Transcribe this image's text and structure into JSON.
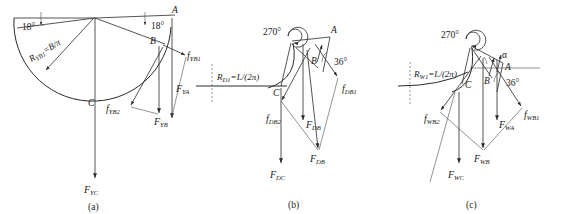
{
  "figure": {
    "panels": [
      {
        "id": "a",
        "caption": "(a)",
        "angles": [
          {
            "name": "left-18",
            "value": "18°"
          },
          {
            "name": "right-18",
            "value": "18°"
          }
        ],
        "points": [
          {
            "name": "A",
            "label": "A"
          },
          {
            "name": "B",
            "label": "B"
          },
          {
            "name": "C",
            "label": "C"
          }
        ],
        "radius_label": {
          "base": "R",
          "sub": "YB1",
          "rest": "=B/π"
        },
        "forces": [
          {
            "name": "f-YB1",
            "base": "f",
            "sub": "YB1"
          },
          {
            "name": "F-YA",
            "base": "F",
            "sub": "YA"
          },
          {
            "name": "F-YB",
            "base": "F",
            "sub": "YB"
          },
          {
            "name": "f-YB2",
            "base": "f",
            "sub": "YB2"
          },
          {
            "name": "F-YC",
            "base": "F",
            "sub": "YC"
          }
        ]
      },
      {
        "id": "b",
        "caption": "(b)",
        "angles": [
          {
            "name": "spiral-270",
            "value": "270°"
          },
          {
            "name": "angle-36",
            "value": "36°"
          }
        ],
        "points": [
          {
            "name": "A",
            "label": "A"
          },
          {
            "name": "B",
            "label": "B"
          },
          {
            "name": "C",
            "label": "C"
          }
        ],
        "radius_label": {
          "base": "R",
          "sub": "D1",
          "rest": "=L/(2π)"
        },
        "forces": [
          {
            "name": "f-DB1",
            "base": "f",
            "sub": "DB1"
          },
          {
            "name": "F-DB-upper",
            "base": "F",
            "sub": "DB"
          },
          {
            "name": "f-DB2",
            "base": "f",
            "sub": "DB2"
          },
          {
            "name": "F-DB-lower",
            "base": "F",
            "sub": "DB"
          },
          {
            "name": "F-DC",
            "base": "F",
            "sub": "DC"
          }
        ]
      },
      {
        "id": "c",
        "caption": "(c)",
        "angles": [
          {
            "name": "spiral-270",
            "value": "270°"
          },
          {
            "name": "angle-36",
            "value": "36°"
          },
          {
            "name": "alpha",
            "value": "α"
          }
        ],
        "points": [
          {
            "name": "A",
            "label": "A"
          },
          {
            "name": "B",
            "label": "B"
          },
          {
            "name": "C",
            "label": "C"
          }
        ],
        "radius_label": {
          "base": "R",
          "sub": "W1",
          "rest": "=L/(2π)"
        },
        "forces": [
          {
            "name": "f-WB1",
            "base": "f",
            "sub": "WB1"
          },
          {
            "name": "F-WA",
            "base": "F",
            "sub": "WA"
          },
          {
            "name": "f-WB2",
            "base": "f",
            "sub": "WB2"
          },
          {
            "name": "F-WB",
            "base": "F",
            "sub": "WB"
          },
          {
            "name": "F-WC",
            "base": "F",
            "sub": "WC"
          }
        ]
      }
    ],
    "colors": {
      "stroke": "#2a2a2a",
      "light_stroke": "#4a4a4a",
      "text": "#1a1a1a",
      "background": "#ffffff"
    }
  }
}
